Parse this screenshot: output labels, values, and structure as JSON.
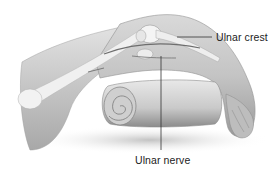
{
  "figure": {
    "labels": [
      {
        "id": "ulnar-crest",
        "text": "Ulnar crest"
      },
      {
        "id": "ulnar-nerve",
        "text": "Ulnar nerve"
      }
    ],
    "colors": {
      "background": "#ffffff",
      "skin_light": "#e6e6e6",
      "skin_mid": "#c8c8c8",
      "skin_dark": "#8f8f8f",
      "bone": "#f2f2f2",
      "nerve": "#6e6e6e",
      "leader_line": "#333333",
      "text": "#222222"
    }
  }
}
